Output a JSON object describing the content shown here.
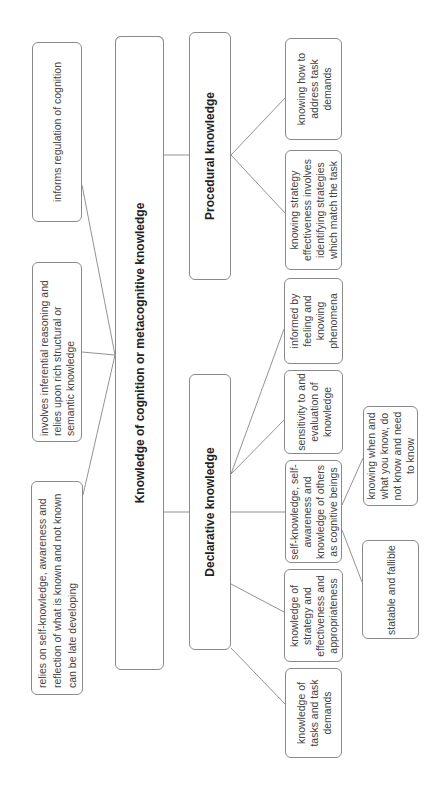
{
  "diagram": {
    "root": {
      "label": "Knowledge of cognition or metacognitive knowledge"
    },
    "properties": [
      {
        "label": "informs regulation of cognition"
      },
      {
        "label": "involves inferential reasoning and relies upon rich structural or semantic knowledge"
      },
      {
        "label": "relies on self-knowledge, awareness and reflection of what is known and not known can be late developing"
      }
    ],
    "branches": {
      "procedural": {
        "label": "Procedural knowledge",
        "children": [
          {
            "label": "knowing how to address task demands"
          },
          {
            "label": "knowing strategy effectiveness involves identifying strategies which match the task"
          }
        ]
      },
      "declarative": {
        "label": "Declarative knowledge",
        "children": [
          {
            "label": "informed by feeling and knowing phenomena"
          },
          {
            "label": "sensitivity to and evaluation of knowledge"
          },
          {
            "label": "self-knowledge, self-awareness and knowledge of others as cognitive beings"
          },
          {
            "label": "knowledge of strategy and effectiveness and appropriateness"
          },
          {
            "label": "knowledge of tasks and task demands"
          }
        ],
        "subchildren": [
          {
            "label": "knowing when and what you know, do not know and need to know"
          },
          {
            "label": "statable and fallible"
          }
        ]
      }
    }
  }
}
